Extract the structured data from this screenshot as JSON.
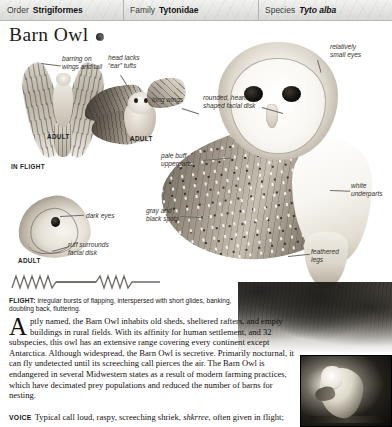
{
  "taxonomy": [
    {
      "key": "Order",
      "value": "Strigiformes",
      "italic": false
    },
    {
      "key": "Family",
      "value": "Tytonidae",
      "italic": false
    },
    {
      "key": "Species",
      "value": "Tyto alba",
      "italic": true
    }
  ],
  "title": {
    "name": "Barn Owl",
    "icon": "nocturnal-circle-icon"
  },
  "plate": {
    "labels": [
      {
        "id": "barring",
        "text": "barring on\nwings and tail"
      },
      {
        "id": "ear-tufts",
        "text": "head lacks\n“ear” tufts"
      },
      {
        "id": "small-eyes",
        "text": "relatively\nsmall eyes"
      },
      {
        "id": "facial-disk",
        "text": "rounded, heart-\nshaped facial disk"
      },
      {
        "id": "long-wings",
        "text": "long wings"
      },
      {
        "id": "pale-buff",
        "text": "pale buff\nupperparts"
      },
      {
        "id": "white-under",
        "text": "white\nunderparts"
      },
      {
        "id": "dark-eyes",
        "text": "dark eyes"
      },
      {
        "id": "ruff",
        "text": "ruff surrounds\nfacial disk"
      },
      {
        "id": "gray-spots",
        "text": "gray and\nblack spots"
      },
      {
        "id": "feathered",
        "text": "feathered\nlegs"
      }
    ],
    "stage_labels": [
      {
        "id": "adult-flight-left",
        "text": "ADULT"
      },
      {
        "id": "adult-flight-right",
        "text": "ADULT"
      },
      {
        "id": "adult-head",
        "text": "ADULT"
      },
      {
        "id": "in-flight",
        "text": "IN FLIGHT"
      }
    ]
  },
  "flight_note": {
    "heading": "FLIGHT:",
    "text": " irregular bursts of flapping, interspersed with short glides, banking, doubling back, fluttering."
  },
  "article": {
    "dropcap": "A",
    "text": "ptly named, the Barn Owl inhabits old sheds, sheltered rafters, and empty buildings in rural fields. With its affinity for human settlement, and 32 subspecies, this owl has an extensive range covering every continent except Antarctica. Although widespread, the Barn Owl is secretive. Primarily nocturnal, it can fly undetected until its screeching call pierces the air. The Barn Owl is endangered in several Midwestern states as a result of modern farming practices, which have decimated prey populations and reduced the number of barns for nesting."
  },
  "voice": {
    "heading": "VOICE",
    "before": "Typical call loud, raspy, screeching shriek, ",
    "call": "shkrree",
    "after": ", often given in flight;"
  },
  "colors": {
    "header_bg": "#e4e4e2",
    "header_border": "#b7b7b5",
    "text": "#14110e",
    "label_text": "#33302c",
    "leader_line": "#6f6c67"
  }
}
